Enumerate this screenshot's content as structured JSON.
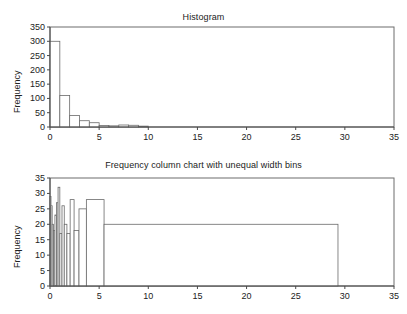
{
  "figure": {
    "background": "#ffffff",
    "axis_color": "#4a4a4a",
    "frame_color": "#6d6d6d"
  },
  "panels": {
    "top": {
      "title": "Histogram",
      "ylabel": "Frequency"
    },
    "bottom": {
      "title": "Frequency column chart with unequal width bins",
      "ylabel": "Frequency"
    }
  },
  "chart_data": [
    {
      "type": "bar",
      "title": "Histogram",
      "xlabel": "",
      "ylabel": "Frequency",
      "xlim": [
        0,
        35
      ],
      "ylim": [
        0,
        350
      ],
      "xticks": [
        0,
        5,
        10,
        15,
        20,
        25,
        30,
        35
      ],
      "yticks": [
        0,
        50,
        100,
        150,
        200,
        250,
        300,
        350
      ],
      "xticklabels": [
        "0",
        "5",
        "10",
        "15",
        "20",
        "25",
        "30",
        "35"
      ],
      "yticklabels": [
        "0",
        "50",
        "100",
        "150",
        "200",
        "250",
        "300",
        "350"
      ],
      "grid": false,
      "legend": null,
      "bin_edges": [
        0,
        1,
        2,
        3,
        4,
        5,
        6,
        7,
        8,
        9,
        10
      ],
      "values": [
        300,
        110,
        40,
        22,
        15,
        5,
        4,
        7,
        6,
        3
      ],
      "bar_fill": "#ffffff",
      "bar_edge": "#6a6a6a"
    },
    {
      "type": "bar",
      "title": "Frequency column chart with unequal width bins",
      "xlabel": "",
      "ylabel": "Frequency",
      "xlim": [
        0,
        35
      ],
      "ylim": [
        0,
        35
      ],
      "xticks": [
        0,
        5,
        10,
        15,
        20,
        25,
        30,
        35
      ],
      "yticks": [
        0,
        5,
        10,
        15,
        20,
        25,
        30,
        35
      ],
      "xticklabels": [
        "0",
        "5",
        "10",
        "15",
        "20",
        "25",
        "30",
        "35"
      ],
      "yticklabels": [
        "0",
        "5",
        "10",
        "15",
        "20",
        "25",
        "30",
        "35"
      ],
      "grid": false,
      "legend": null,
      "unequal_width_bins": [
        {
          "x0": 0.0,
          "x1": 0.1,
          "height": 29
        },
        {
          "x0": 0.1,
          "x1": 0.22,
          "height": 26
        },
        {
          "x0": 0.22,
          "x1": 0.36,
          "height": 20
        },
        {
          "x0": 0.36,
          "x1": 0.5,
          "height": 18
        },
        {
          "x0": 0.5,
          "x1": 0.66,
          "height": 23
        },
        {
          "x0": 0.66,
          "x1": 0.82,
          "height": 27
        },
        {
          "x0": 0.82,
          "x1": 1.0,
          "height": 32
        },
        {
          "x0": 1.0,
          "x1": 1.22,
          "height": 17
        },
        {
          "x0": 1.22,
          "x1": 1.45,
          "height": 26
        },
        {
          "x0": 1.45,
          "x1": 1.72,
          "height": 20
        },
        {
          "x0": 1.72,
          "x1": 2.05,
          "height": 17
        },
        {
          "x0": 2.05,
          "x1": 2.45,
          "height": 28
        },
        {
          "x0": 2.45,
          "x1": 2.95,
          "height": 18
        },
        {
          "x0": 2.95,
          "x1": 3.7,
          "height": 25
        },
        {
          "x0": 3.7,
          "x1": 5.5,
          "height": 28
        },
        {
          "x0": 5.5,
          "x1": 29.3,
          "height": 20
        }
      ],
      "bar_fill": "#ffffff",
      "bar_edge": "#6a6a6a"
    }
  ]
}
